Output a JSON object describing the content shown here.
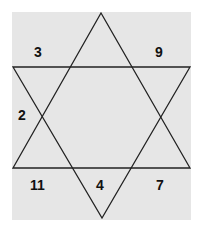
{
  "diagram": {
    "background_color": "#e6e6e6",
    "line_color": "#222222",
    "shape": "six-pointed star (two overlapping triangles)",
    "labels": [
      {
        "id": "top-left",
        "value": "3",
        "x": 34,
        "y": 45
      },
      {
        "id": "top-right",
        "value": "9",
        "x": 155,
        "y": 45
      },
      {
        "id": "left",
        "value": "2",
        "x": 18,
        "y": 108
      },
      {
        "id": "bottom-left",
        "value": "11",
        "x": 30,
        "y": 178
      },
      {
        "id": "bottom-center",
        "value": "4",
        "x": 96,
        "y": 178
      },
      {
        "id": "bottom-right",
        "value": "7",
        "x": 156,
        "y": 178
      }
    ]
  }
}
